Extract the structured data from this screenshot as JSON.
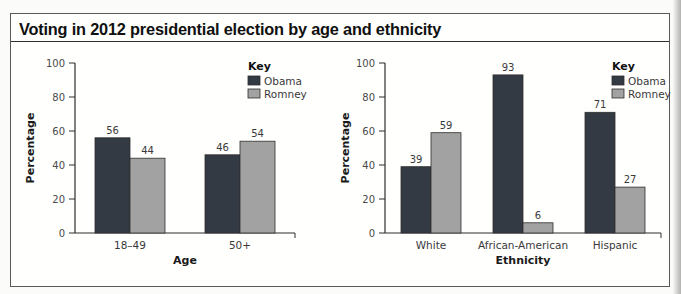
{
  "figure": {
    "cropped_top_label": "SOURCE 8",
    "title": "Voting in 2012 presidential election by age and ethnicity"
  },
  "colors": {
    "obama": "#343a44",
    "romney": "#a2a2a3",
    "bar_outline": "#2e2e2e",
    "axis": "#2e2e2e",
    "tick_label": "#4a4a4a",
    "value_label": "#3a3a3a",
    "axis_title": "#1a1a1a",
    "box_border": "#595959"
  },
  "chart_data": [
    {
      "type": "bar",
      "name": "age",
      "categories": [
        "18–49",
        "50+"
      ],
      "series": [
        {
          "name": "Obama",
          "color": "#343a44",
          "values": [
            56,
            46
          ]
        },
        {
          "name": "Romney",
          "color": "#a2a2a3",
          "values": [
            44,
            54
          ]
        }
      ],
      "xlabel": "Age",
      "ylabel": "Percentage",
      "ylim": [
        0,
        100
      ],
      "yticks": [
        0,
        20,
        40,
        60,
        80,
        100
      ],
      "grid": false,
      "bar_value_labels": true,
      "legend_title": "Key",
      "legend_position": "top-right"
    },
    {
      "type": "bar",
      "name": "ethnicity",
      "categories": [
        "White",
        "African-American",
        "Hispanic"
      ],
      "series": [
        {
          "name": "Obama",
          "color": "#343a44",
          "values": [
            39,
            93,
            71
          ]
        },
        {
          "name": "Romney",
          "color": "#a2a2a3",
          "values": [
            59,
            6,
            27
          ]
        }
      ],
      "xlabel": "Ethnicity",
      "ylabel": "Percentage",
      "ylim": [
        0,
        100
      ],
      "yticks": [
        0,
        20,
        40,
        60,
        80,
        100
      ],
      "grid": false,
      "bar_value_labels": true,
      "legend_title": "Key",
      "legend_position": "top-right"
    }
  ]
}
